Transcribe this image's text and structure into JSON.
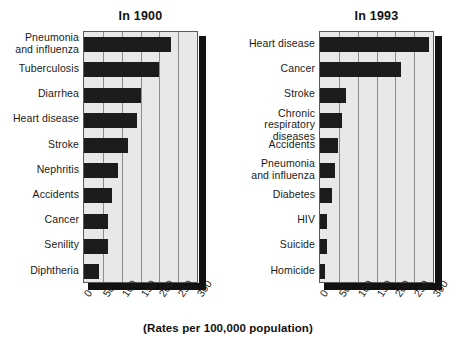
{
  "caption": "(Rates per 100,000 population)",
  "axis": {
    "ticks": [
      "0",
      "50",
      "100",
      "150",
      "200",
      "250",
      "300"
    ],
    "min": 0,
    "max": 300
  },
  "colors": {
    "bar": "#1c1c1c",
    "plot_background": "#e8e8e8",
    "grid": "#8d8d8d",
    "shadow": "#111111",
    "text": "#1a1a1a"
  },
  "panels": [
    {
      "id": "1900",
      "title": "In 1900",
      "categories": [
        "Pneumonia\nand influenza",
        "Tuberculosis",
        "Diarrhea",
        "Heart disease",
        "Stroke",
        "Nephritis",
        "Accidents",
        "Cancer",
        "Senility",
        "Diphtheria"
      ],
      "values": [
        230,
        200,
        150,
        140,
        118,
        89,
        75,
        64,
        63,
        40
      ]
    },
    {
      "id": "1993",
      "title": "In 1993",
      "categories": [
        "Heart disease",
        "Cancer",
        "Stroke",
        "Chronic respiratory\ndiseases",
        "Accidents",
        "Pneumonia\nand influenza",
        "Diabetes",
        "HIV",
        "Suicide",
        "Homicide"
      ],
      "values": [
        290,
        215,
        70,
        58,
        47,
        40,
        32,
        19,
        18,
        14
      ]
    }
  ],
  "chart_data": {
    "type": "bar",
    "orientation": "horizontal",
    "xlabel": "(Rates per 100,000 population)",
    "ylabel": "",
    "xlim": [
      0,
      300
    ],
    "xticks": [
      0,
      50,
      100,
      150,
      200,
      250,
      300
    ],
    "grid": true,
    "legend": "none",
    "panels": [
      {
        "title": "In 1900",
        "categories": [
          "Pneumonia and influenza",
          "Tuberculosis",
          "Diarrhea",
          "Heart disease",
          "Stroke",
          "Nephritis",
          "Accidents",
          "Cancer",
          "Senility",
          "Diphtheria"
        ],
        "values": [
          230,
          200,
          150,
          140,
          118,
          89,
          75,
          64,
          63,
          40
        ]
      },
      {
        "title": "In 1993",
        "categories": [
          "Heart disease",
          "Cancer",
          "Stroke",
          "Chronic respiratory diseases",
          "Accidents",
          "Pneumonia and influenza",
          "Diabetes",
          "HIV",
          "Suicide",
          "Homicide"
        ],
        "values": [
          290,
          215,
          70,
          58,
          47,
          40,
          32,
          19,
          18,
          14
        ]
      }
    ]
  }
}
